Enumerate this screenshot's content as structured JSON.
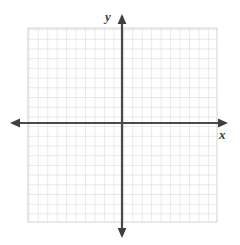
{
  "figure": {
    "title": "",
    "background_color": "#ffffff",
    "width": 240,
    "height": 245
  },
  "axis_labels": {
    "x": "x",
    "y": "y"
  },
  "chart_data": {
    "type": "scatter",
    "title": "",
    "subtitle": "",
    "xlabel": "x",
    "ylabel": "y",
    "series": [
      {
        "name": "",
        "x": [],
        "y": []
      }
    ],
    "annotations": [],
    "legend": {
      "show": false,
      "position": "none",
      "entries": []
    },
    "grid": {
      "show": true,
      "columns": 20,
      "rows": 20,
      "cell_size_px": 9.45,
      "line_color": "#c9c9c9",
      "line_width_px": 0.8,
      "left_px": 28,
      "top_px": 28,
      "right_px": 217,
      "bottom_px": 222
    },
    "axes": {
      "x_axis": {
        "label": "x",
        "position_px": 123,
        "start_px": 10,
        "end_px": 228,
        "color": "#4a4a4a",
        "line_width_px": 2.2,
        "arrow_start": true,
        "arrow_end": true,
        "tick_labels": [],
        "ticks": [],
        "xlim": [
          -10,
          10
        ]
      },
      "y_axis": {
        "label": "y",
        "position_px": 122,
        "start_px": 14,
        "end_px": 238,
        "color": "#4a4a4a",
        "line_width_px": 2.2,
        "arrow_start": true,
        "arrow_end": true,
        "tick_labels": [],
        "ticks": [],
        "ylim": [
          -10,
          10
        ]
      }
    },
    "origin": {
      "x_px": 122,
      "y_px": 123,
      "label": ""
    }
  }
}
